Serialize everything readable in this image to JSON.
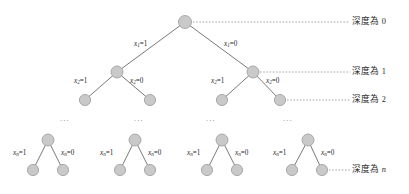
{
  "figure": {
    "colors": {
      "node_fill": "#c9c9c9",
      "node_stroke": "#9a9a9a",
      "edge_stroke": "#6a6a6a",
      "leader_stroke": "#8d8d8d",
      "text": "#2b2b2b",
      "ellipsis": "#8a8a8a",
      "background": "#ffffff"
    },
    "nodes": [
      {
        "id": "root",
        "cx": 185,
        "cy": 22,
        "r": 6.5
      },
      {
        "id": "d1l",
        "cx": 117,
        "cy": 72,
        "r": 6.0
      },
      {
        "id": "d1r",
        "cx": 253,
        "cy": 72,
        "r": 6.0
      },
      {
        "id": "d2a",
        "cx": 85,
        "cy": 100,
        "r": 5.6
      },
      {
        "id": "d2b",
        "cx": 150,
        "cy": 100,
        "r": 5.6
      },
      {
        "id": "d2c",
        "cx": 222,
        "cy": 100,
        "r": 5.6
      },
      {
        "id": "d2d",
        "cx": 280,
        "cy": 100,
        "r": 5.6
      },
      {
        "id": "g1p",
        "cx": 48,
        "cy": 140,
        "r": 6.0
      },
      {
        "id": "g1l",
        "cx": 33,
        "cy": 170,
        "r": 5.6
      },
      {
        "id": "g1r",
        "cx": 63,
        "cy": 170,
        "r": 5.6
      },
      {
        "id": "g2p",
        "cx": 135,
        "cy": 140,
        "r": 6.0
      },
      {
        "id": "g2l",
        "cx": 120,
        "cy": 170,
        "r": 5.6
      },
      {
        "id": "g2r",
        "cx": 150,
        "cy": 170,
        "r": 5.6
      },
      {
        "id": "g3p",
        "cx": 222,
        "cy": 140,
        "r": 6.0
      },
      {
        "id": "g3l",
        "cx": 207,
        "cy": 170,
        "r": 5.6
      },
      {
        "id": "g3r",
        "cx": 237,
        "cy": 170,
        "r": 5.6
      },
      {
        "id": "g4p",
        "cx": 308,
        "cy": 140,
        "r": 6.0
      },
      {
        "id": "g4l",
        "cx": 292,
        "cy": 170,
        "r": 5.6
      },
      {
        "id": "g4r",
        "cx": 322,
        "cy": 170,
        "r": 5.6
      }
    ],
    "edges": [
      {
        "from": "root",
        "to": "d1l"
      },
      {
        "from": "root",
        "to": "d1r"
      },
      {
        "from": "d1l",
        "to": "d2a"
      },
      {
        "from": "d1l",
        "to": "d2b"
      },
      {
        "from": "d1r",
        "to": "d2c"
      },
      {
        "from": "d1r",
        "to": "d2d"
      },
      {
        "from": "g1p",
        "to": "g1l"
      },
      {
        "from": "g1p",
        "to": "g1r"
      },
      {
        "from": "g2p",
        "to": "g2l"
      },
      {
        "from": "g2p",
        "to": "g2r"
      },
      {
        "from": "g3p",
        "to": "g3l"
      },
      {
        "from": "g3p",
        "to": "g3r"
      },
      {
        "from": "g4p",
        "to": "g4l"
      },
      {
        "from": "g4p",
        "to": "g4r"
      }
    ],
    "edge_labels": [
      {
        "id": "e-root-left",
        "var": "x",
        "sub": "1",
        "eq": "=",
        "value": "1",
        "x": 134,
        "y": 41
      },
      {
        "id": "e-root-right",
        "var": "x",
        "sub": "1",
        "eq": "=",
        "value": "0",
        "x": 224,
        "y": 41
      },
      {
        "id": "e-d1l-left",
        "var": "x",
        "sub": "2",
        "eq": "=",
        "value": "1",
        "x": 74,
        "y": 78
      },
      {
        "id": "e-d1l-right",
        "var": "x",
        "sub": "2",
        "eq": "=",
        "value": "0",
        "x": 130,
        "y": 78
      },
      {
        "id": "e-d1r-left",
        "var": "x",
        "sub": "2",
        "eq": "=",
        "value": "1",
        "x": 211,
        "y": 78
      },
      {
        "id": "e-d1r-right",
        "var": "x",
        "sub": "2",
        "eq": "=",
        "value": "0",
        "x": 266,
        "y": 78
      },
      {
        "id": "e-g1-left",
        "var": "x",
        "sub": "n",
        "eq": "=",
        "value": "1",
        "x": 13,
        "y": 150
      },
      {
        "id": "e-g1-right",
        "var": "x",
        "sub": "n",
        "eq": "=",
        "value": "0",
        "x": 61,
        "y": 150
      },
      {
        "id": "e-g2-left",
        "var": "x",
        "sub": "n",
        "eq": "=",
        "value": "1",
        "x": 100,
        "y": 150
      },
      {
        "id": "e-g2-right",
        "var": "x",
        "sub": "n",
        "eq": "=",
        "value": "0",
        "x": 148,
        "y": 150
      },
      {
        "id": "e-g3-left",
        "var": "x",
        "sub": "n",
        "eq": "=",
        "value": "1",
        "x": 187,
        "y": 150
      },
      {
        "id": "e-g3-right",
        "var": "x",
        "sub": "n",
        "eq": "=",
        "value": "0",
        "x": 235,
        "y": 150
      },
      {
        "id": "e-g4-left",
        "var": "x",
        "sub": "n",
        "eq": "=",
        "value": "1",
        "x": 273,
        "y": 150
      },
      {
        "id": "e-g4-right",
        "var": "x",
        "sub": "n",
        "eq": "=",
        "value": "0",
        "x": 321,
        "y": 150
      }
    ],
    "depth_labels": [
      {
        "id": "depth-0",
        "text": "深度為",
        "value": "0",
        "italic": false,
        "x": 352,
        "y": 17,
        "leader": {
          "x1": 193,
          "y1": 22,
          "x2": 350,
          "y2": 22
        }
      },
      {
        "id": "depth-1",
        "text": "深度為",
        "value": "1",
        "italic": false,
        "x": 352,
        "y": 67,
        "leader": {
          "x1": 260,
          "y1": 72,
          "x2": 350,
          "y2": 72
        }
      },
      {
        "id": "depth-2",
        "text": "深度為",
        "value": "2",
        "italic": false,
        "x": 352,
        "y": 95,
        "leader": {
          "x1": 287,
          "y1": 100,
          "x2": 350,
          "y2": 100
        }
      },
      {
        "id": "depth-n",
        "text": "深度為",
        "value": "n",
        "italic": true,
        "x": 352,
        "y": 165,
        "leader": {
          "x1": 329,
          "y1": 170,
          "x2": 350,
          "y2": 170
        }
      }
    ],
    "ellipses": [
      {
        "id": "ellipsis-1",
        "text": "...",
        "x": 60,
        "y": 114
      },
      {
        "id": "ellipsis-2",
        "text": "...",
        "x": 134,
        "y": 114
      },
      {
        "id": "ellipsis-3",
        "text": "...",
        "x": 206,
        "y": 114
      },
      {
        "id": "ellipsis-4",
        "text": "...",
        "x": 283,
        "y": 114
      }
    ]
  }
}
